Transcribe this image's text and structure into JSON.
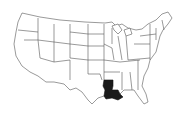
{
  "map": {
    "title": "United States",
    "region": "Contiguous United States",
    "highlighted_state": "Louisiana",
    "colors": {
      "background": "#ffffff",
      "state_fill": "#ffffff",
      "state_border": "#555555",
      "highlight_fill": "#1a1a1a"
    }
  }
}
